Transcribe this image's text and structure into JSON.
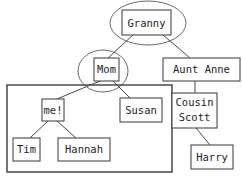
{
  "diagram": {
    "type": "family-tree",
    "colors": {
      "background": "#ffffff",
      "box_stroke": "#4a4a4a",
      "group_stroke": "#3d3d3d",
      "edge_stroke": "#4a4a4a",
      "text": "#1d1d1d"
    },
    "nodes": [
      {
        "id": "granny",
        "label": "Granny",
        "x": 122,
        "y": 10,
        "w": 49,
        "h": 25,
        "lines": [
          "Granny"
        ]
      },
      {
        "id": "mom",
        "label": "Mom",
        "x": 94,
        "y": 58,
        "w": 25,
        "h": 23,
        "lines": [
          "Mom"
        ]
      },
      {
        "id": "aunt",
        "label": "Aunt Anne",
        "x": 163,
        "y": 58,
        "w": 77,
        "h": 23,
        "lines": [
          "Aunt Anne"
        ]
      },
      {
        "id": "me",
        "label": "me!",
        "x": 42,
        "y": 99,
        "w": 22,
        "h": 22,
        "lines": [
          "me!"
        ]
      },
      {
        "id": "susan",
        "label": "Susan",
        "x": 120,
        "y": 98,
        "w": 42,
        "h": 24,
        "lines": [
          "Susan"
        ]
      },
      {
        "id": "cousin",
        "label": "Cousin Scott",
        "x": 172,
        "y": 93,
        "w": 45,
        "h": 35,
        "lines": [
          "Cousin",
          "Scott"
        ]
      },
      {
        "id": "tim",
        "label": "Tim",
        "x": 13,
        "y": 138,
        "w": 27,
        "h": 23,
        "lines": [
          "Tim"
        ]
      },
      {
        "id": "hannah",
        "label": "Hannah",
        "x": 58,
        "y": 138,
        "w": 52,
        "h": 23,
        "lines": [
          "Hannah"
        ]
      },
      {
        "id": "harry",
        "label": "Harry",
        "x": 191,
        "y": 145,
        "w": 42,
        "h": 24,
        "lines": [
          "Harry"
        ]
      }
    ],
    "groups": [
      {
        "id": "granny-circle",
        "shape": "ellipse",
        "around": "granny",
        "cx": 148,
        "cy": 23,
        "rx": 38,
        "ry": 22
      },
      {
        "id": "mom-circle",
        "shape": "ellipse",
        "around": "mom",
        "cx": 103,
        "cy": 71,
        "rx": 25,
        "ry": 21
      },
      {
        "id": "household-rect",
        "shape": "rect",
        "around": "me-tim-hannah",
        "x": 7,
        "y": 85,
        "w": 165,
        "h": 87
      }
    ],
    "edges": [
      {
        "id": "granny-mom",
        "from": "granny",
        "to": "mom",
        "x1": 133,
        "y1": 35,
        "x2": 108,
        "y2": 58
      },
      {
        "id": "granny-aunt",
        "from": "granny",
        "to": "aunt",
        "x1": 163,
        "y1": 35,
        "x2": 190,
        "y2": 58
      },
      {
        "id": "mom-me",
        "from": "mom",
        "to": "me",
        "x1": 100,
        "y1": 81,
        "x2": 57,
        "y2": 99
      },
      {
        "id": "mom-susan",
        "from": "mom",
        "to": "susan",
        "x1": 113,
        "y1": 81,
        "x2": 130,
        "y2": 98
      },
      {
        "id": "aunt-cousin",
        "from": "aunt",
        "to": "cousin",
        "x1": 195,
        "y1": 81,
        "x2": 195,
        "y2": 93
      },
      {
        "id": "cousin-harry",
        "from": "cousin",
        "to": "harry",
        "x1": 196,
        "y1": 128,
        "x2": 210,
        "y2": 145
      },
      {
        "id": "me-tim",
        "from": "me",
        "to": "tim",
        "x1": 48,
        "y1": 121,
        "x2": 30,
        "y2": 138
      },
      {
        "id": "me-hannah",
        "from": "me",
        "to": "hannah",
        "x1": 57,
        "y1": 121,
        "x2": 76,
        "y2": 138
      }
    ]
  }
}
